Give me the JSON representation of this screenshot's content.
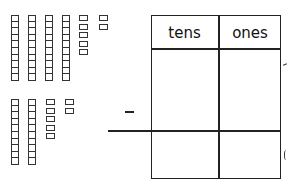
{
  "problem": {
    "operation": "subtraction",
    "operator_symbol": "−",
    "minuend": {
      "tens_rods": 4,
      "ones_cubes": 7,
      "ones_columns": [
        5,
        2
      ],
      "value": 47
    },
    "subtrahend": {
      "tens_rods": 2,
      "ones_cubes": 7,
      "ones_columns": [
        5,
        2
      ],
      "value": 27
    }
  },
  "place_value_table": {
    "headers": [
      "tens",
      "ones"
    ],
    "rows": [
      {
        "tens": "",
        "ones": ""
      },
      {
        "tens": "",
        "ones": ""
      }
    ]
  },
  "colors": {
    "line": "#222222",
    "background": "#ffffff"
  }
}
